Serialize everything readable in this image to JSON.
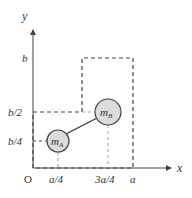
{
  "diagram": {
    "axes": {
      "x_label": "x",
      "y_label": "y",
      "origin_label": "O"
    },
    "x_ticks": [
      {
        "label": "a/4",
        "pos": 58
      },
      {
        "label": "3a/4",
        "pos": 108
      },
      {
        "label": "a",
        "pos": 133
      }
    ],
    "y_ticks": [
      {
        "label": "b",
        "pos": 58
      },
      {
        "label": "b/2",
        "pos": 112
      },
      {
        "label": "b/4",
        "pos": 141
      }
    ],
    "masses": [
      {
        "name": "mA",
        "main": "m",
        "sub": "A",
        "cx": 58,
        "cy": 141,
        "r": 11
      },
      {
        "name": "mB",
        "main": "m",
        "sub": "B",
        "cx": 108,
        "cy": 112,
        "r": 13
      }
    ],
    "colors": {
      "line": "#444444",
      "mass_fill": "#dcdcdc",
      "text": "#333333"
    }
  }
}
